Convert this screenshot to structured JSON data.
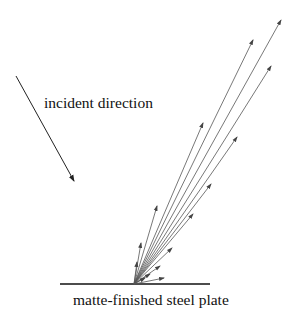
{
  "labels": {
    "incident": "incident direction",
    "plate": "matte-finished steel plate"
  },
  "colors": {
    "ink": "#111111",
    "ray": "#555555",
    "background": "#ffffff"
  },
  "geometry": {
    "origin": [
      134,
      284
    ],
    "plate_line": [
      [
        60,
        284
      ],
      [
        210,
        284
      ]
    ],
    "incident_arrow": [
      [
        16,
        76
      ],
      [
        74,
        181
      ]
    ],
    "reflected_ray_tips": [
      [
        281,
        20
      ],
      [
        253,
        40
      ],
      [
        271,
        66
      ],
      [
        203,
        123
      ],
      [
        237,
        137
      ],
      [
        211,
        184
      ],
      [
        157,
        206
      ],
      [
        193,
        214
      ],
      [
        141,
        243
      ],
      [
        172,
        248
      ],
      [
        160,
        266
      ],
      [
        150,
        274
      ],
      [
        137,
        262
      ],
      [
        164,
        278
      ],
      [
        145,
        278
      ]
    ]
  }
}
